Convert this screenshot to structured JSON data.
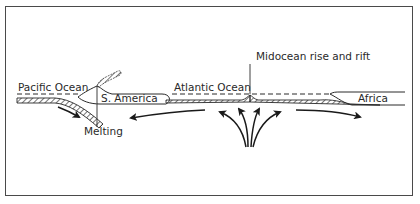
{
  "diagram": {
    "type": "cross-section",
    "labels": {
      "pacific": "Pacific Ocean",
      "south_america": "S. America",
      "atlantic": "Atlantic Ocean",
      "rift": "Midocean rise and rift",
      "africa": "Africa",
      "melting": "Melting"
    },
    "colors": {
      "stroke": "#2a2a2a",
      "frame": "#4a4a4a",
      "background": "#ffffff"
    }
  }
}
